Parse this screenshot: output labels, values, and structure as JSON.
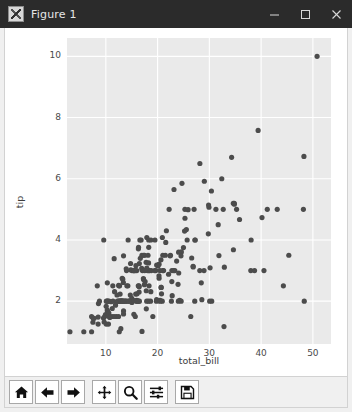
{
  "window": {
    "title": "Figure 1",
    "icon": "matplotlib-figure-icon",
    "controls": [
      {
        "name": "minimize-button",
        "glyph": "—",
        "label": "Minimize"
      },
      {
        "name": "maximize-button",
        "glyph": "□",
        "label": "Maximize"
      },
      {
        "name": "close-button",
        "glyph": "✕",
        "label": "Close"
      }
    ]
  },
  "colors": {
    "titlebar_bg": "#2b2b2b",
    "titlebar_fg": "#e6e6e6",
    "figure_bg": "#ffffff",
    "axes_bg": "#eaeaea",
    "grid": "#ffffff",
    "point": "#4c4c4c",
    "tick_text": "#4a4a4a",
    "toolbar_bg": "#f0f0f0"
  },
  "toolbar": {
    "buttons": [
      {
        "name": "home-button",
        "icon": "home-icon",
        "tooltip": "Reset original view"
      },
      {
        "name": "back-button",
        "icon": "arrow-left-icon",
        "tooltip": "Back to previous view"
      },
      {
        "name": "forward-button",
        "icon": "arrow-right-icon",
        "tooltip": "Forward to next view"
      },
      {
        "name": "pan-button",
        "icon": "move-cross-icon",
        "tooltip": "Pan axes with left mouse, zoom with right"
      },
      {
        "name": "zoom-button",
        "icon": "magnifier-icon",
        "tooltip": "Zoom to rectangle"
      },
      {
        "name": "subplots-button",
        "icon": "sliders-icon",
        "tooltip": "Configure subplots"
      },
      {
        "name": "save-button",
        "icon": "floppy-disk-icon",
        "tooltip": "Save the figure"
      }
    ]
  },
  "chart_data": {
    "type": "scatter",
    "title": "",
    "xlabel": "total_bill",
    "ylabel": "tip",
    "xlim": [
      2.5,
      53.5
    ],
    "ylim": [
      0.6,
      10.6
    ],
    "xticks": [
      10,
      20,
      30,
      40,
      50
    ],
    "yticks": [
      2,
      4,
      6,
      8,
      10
    ],
    "xticklabels": [
      "10",
      "20",
      "30",
      "40",
      "50"
    ],
    "yticklabels": [
      "2",
      "4",
      "6",
      "8",
      "10"
    ],
    "grid": true,
    "grid_color": "#ffffff",
    "legend": null,
    "marker": "o",
    "marker_color": "#4c4c4c",
    "marker_size": 4,
    "n_points": 244,
    "series": [
      {
        "name": "tips",
        "x": [
          16.99,
          10.34,
          21.01,
          23.68,
          24.59,
          25.29,
          8.77,
          26.88,
          15.04,
          14.78,
          10.27,
          35.26,
          15.42,
          18.43,
          14.83,
          21.58,
          10.33,
          16.29,
          16.97,
          20.65,
          17.92,
          20.29,
          15.77,
          39.42,
          19.82,
          17.81,
          13.37,
          12.69,
          21.7,
          19.65,
          9.55,
          18.35,
          15.06,
          20.69,
          17.78,
          24.06,
          16.31,
          16.93,
          18.69,
          31.27,
          16.04,
          17.46,
          13.94,
          9.68,
          30.4,
          18.29,
          22.23,
          32.4,
          28.55,
          18.04,
          12.54,
          10.29,
          34.81,
          9.94,
          25.56,
          19.49,
          38.01,
          26.41,
          11.24,
          48.27,
          20.29,
          13.81,
          11.02,
          18.29,
          17.59,
          20.08,
          16.45,
          3.07,
          20.23,
          15.01,
          12.02,
          17.07,
          26.86,
          25.28,
          14.73,
          10.51,
          17.92,
          27.2,
          22.76,
          17.29,
          19.44,
          16.66,
          10.07,
          32.68,
          15.98,
          34.83,
          13.03,
          18.28,
          24.71,
          21.16,
          28.97,
          22.49,
          5.75,
          16.32,
          22.75,
          40.17,
          27.28,
          12.03,
          21.01,
          12.46,
          11.35,
          15.38,
          44.3,
          22.42,
          20.92,
          15.36,
          20.49,
          25.21,
          18.24,
          14.31,
          14.0,
          7.25,
          38.07,
          23.95,
          25.71,
          17.31,
          29.93,
          10.65,
          12.43,
          24.08,
          11.69,
          13.42,
          14.26,
          15.95,
          12.48,
          29.8,
          8.52,
          14.52,
          11.38,
          22.82,
          19.08,
          20.27,
          11.17,
          12.26,
          18.26,
          8.51,
          10.33,
          14.15,
          16.0,
          13.16,
          17.47,
          34.3,
          41.19,
          27.05,
          16.43,
          8.35,
          18.64,
          11.87,
          9.78,
          7.51,
          14.07,
          13.13,
          17.26,
          24.55,
          19.77,
          29.85,
          48.17,
          25.0,
          13.39,
          16.49,
          21.5,
          12.66,
          16.21,
          13.81,
          17.51,
          24.52,
          20.76,
          31.71,
          10.59,
          10.63,
          50.81,
          15.81,
          7.25,
          31.85,
          16.82,
          32.9,
          17.89,
          14.48,
          9.6,
          34.63,
          34.65,
          23.33,
          45.35,
          23.17,
          40.55,
          20.69,
          20.9,
          30.46,
          18.15,
          23.1,
          15.69,
          19.81,
          28.44,
          15.48,
          16.58,
          7.56,
          10.34,
          43.11,
          13.0,
          13.51,
          18.71,
          12.74,
          13.0,
          16.4,
          20.53,
          16.47,
          26.59,
          38.73,
          24.27,
          12.76,
          30.06,
          25.89,
          48.33,
          13.27,
          28.17,
          12.9,
          28.15,
          11.59,
          7.74,
          30.14,
          12.16,
          13.42,
          8.58,
          15.98,
          13.42,
          16.27,
          10.09,
          20.45,
          13.28,
          22.12,
          24.01,
          15.69,
          11.61,
          10.77,
          15.53,
          10.07,
          12.6,
          32.83,
          35.83,
          29.03,
          27.18,
          22.67,
          17.82,
          18.78
        ],
        "y": [
          1.01,
          1.66,
          3.5,
          3.31,
          3.61,
          4.71,
          2.0,
          3.12,
          1.96,
          3.23,
          1.71,
          5.0,
          1.57,
          3.0,
          3.02,
          3.92,
          1.67,
          3.71,
          3.5,
          3.35,
          4.08,
          2.75,
          2.23,
          7.58,
          3.18,
          2.34,
          2.0,
          2.0,
          4.3,
          3.0,
          1.45,
          2.5,
          3.0,
          2.45,
          3.27,
          3.6,
          2.0,
          3.07,
          2.31,
          5.0,
          2.24,
          2.54,
          3.06,
          1.32,
          5.6,
          3.0,
          5.0,
          6.0,
          2.05,
          3.0,
          2.5,
          2.6,
          5.2,
          1.56,
          4.34,
          4.0,
          3.0,
          1.5,
          1.76,
          6.73,
          3.21,
          2.0,
          1.98,
          3.76,
          2.64,
          3.15,
          2.47,
          1.0,
          2.01,
          2.09,
          1.97,
          3.0,
          3.14,
          5.0,
          2.2,
          1.25,
          3.08,
          4.0,
          3.0,
          2.71,
          3.0,
          3.4,
          1.83,
          5.0,
          2.03,
          5.17,
          2.0,
          4.0,
          5.85,
          3.0,
          3.0,
          3.5,
          1.0,
          3.76,
          2.64,
          4.73,
          4.0,
          1.5,
          3.0,
          1.5,
          2.5,
          3.0,
          2.5,
          3.48,
          4.08,
          3.0,
          2.03,
          4.29,
          2.0,
          4.0,
          3.0,
          1.0,
          4.0,
          2.55,
          4.0,
          3.5,
          5.07,
          1.5,
          2.0,
          2.92,
          2.31,
          1.68,
          2.5,
          2.0,
          2.52,
          4.2,
          1.48,
          2.0,
          2.0,
          2.18,
          1.5,
          2.83,
          1.5,
          2.0,
          3.25,
          1.25,
          2.0,
          2.0,
          2.0,
          2.75,
          3.5,
          6.7,
          5.0,
          5.0,
          2.3,
          2.5,
          2.0,
          1.87,
          1.5,
          1.31,
          2.5,
          2.0,
          2.74,
          2.0,
          2.0,
          5.14,
          5.0,
          3.75,
          2.61,
          2.0,
          3.5,
          2.5,
          2.0,
          2.0,
          3.0,
          3.48,
          2.24,
          4.5,
          1.61,
          2.0,
          10.0,
          3.16,
          1.5,
          3.49,
          4.0,
          3.11,
          2.0,
          2.0,
          4.0,
          5.2,
          3.68,
          3.0,
          3.5,
          5.65,
          3.0,
          2.45,
          2.0,
          2.0,
          3.5,
          3.0,
          1.5,
          2.05,
          2.6,
          2.02,
          4.0,
          1.44,
          2.0,
          5.0,
          2.0,
          2.0,
          4.0,
          2.01,
          2.0,
          2.5,
          2.0,
          3.23,
          3.41,
          3.0,
          2.03,
          2.23,
          2.0,
          4.99,
          2.0,
          2.0,
          6.5,
          1.1,
          3.0,
          1.5,
          1.44,
          3.09,
          2.2,
          3.48,
          1.92,
          3.0,
          1.58,
          2.5,
          2.0,
          3.0,
          2.72,
          2.88,
          2.0,
          3.0,
          3.39,
          1.47,
          3.0,
          1.25,
          1.0,
          1.17,
          4.67,
          5.92,
          2.0,
          2.0,
          1.75,
          3.0
        ]
      }
    ]
  }
}
